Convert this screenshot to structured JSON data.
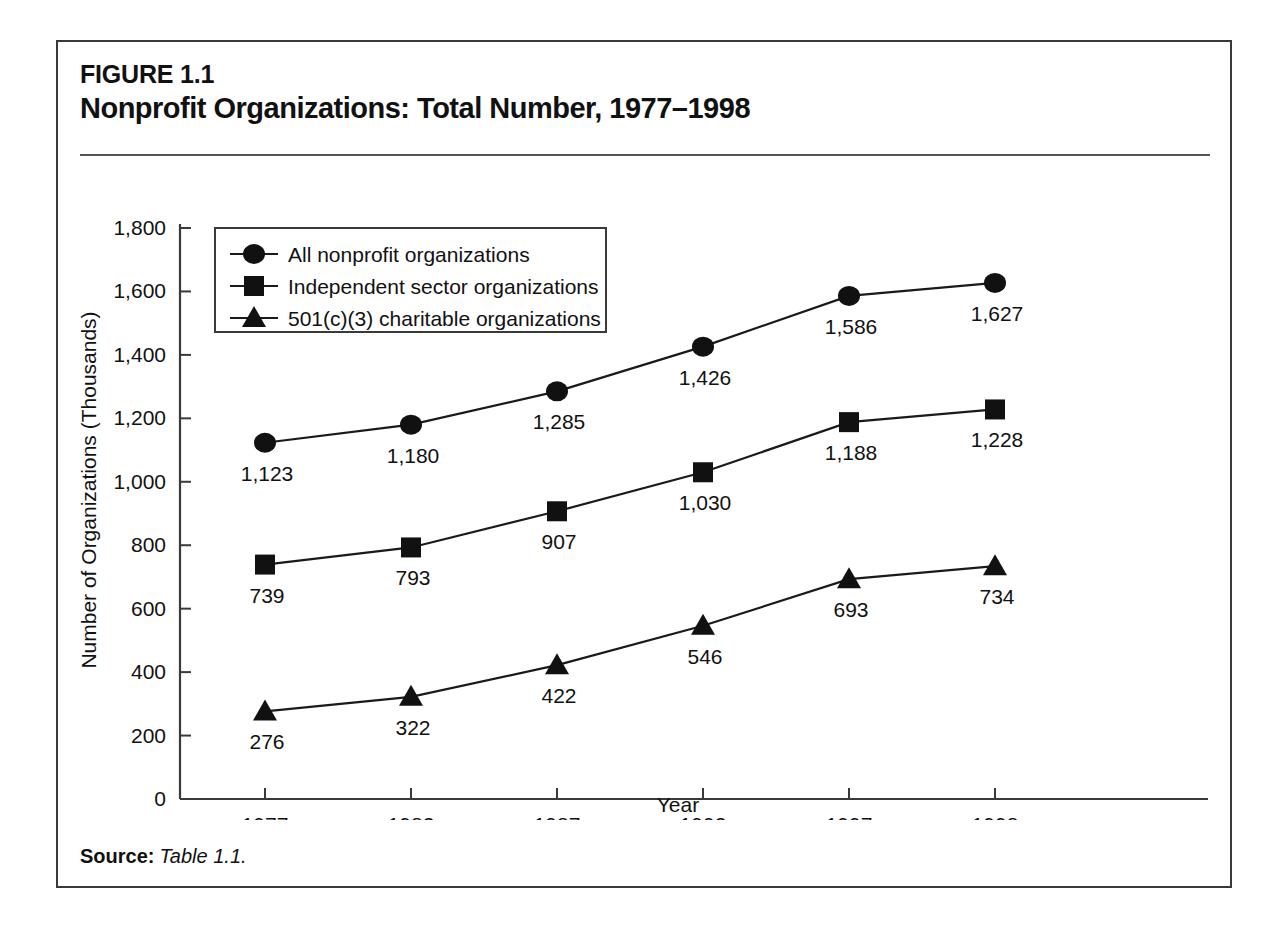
{
  "figure": {
    "number": "FIGURE 1.1",
    "title": "Nonprofit Organizations: Total Number, 1977–1998",
    "source_label": "Source:",
    "source_text": "Table 1.1."
  },
  "chart_data": {
    "type": "line",
    "title": "Nonprofit Organizations: Total Number, 1977–1998",
    "xlabel": "Year",
    "ylabel": "Number of Organizations (Thousands)",
    "categories": [
      "1977",
      "1982",
      "1987",
      "1992",
      "1997",
      "1998"
    ],
    "ylim": [
      0,
      1800
    ],
    "yticks": [
      0,
      200,
      400,
      600,
      800,
      1000,
      1200,
      1400,
      1600,
      1800
    ],
    "ytick_labels": [
      "0",
      "200",
      "400",
      "600",
      "800",
      "1,000",
      "1,200",
      "1,400",
      "1,600",
      "1,800"
    ],
    "grid": false,
    "legend_position": "upper-left",
    "series": [
      {
        "name": "All nonprofit organizations",
        "marker": "circle",
        "values": [
          1123,
          1180,
          1285,
          1426,
          1586,
          1627
        ],
        "labels": [
          "1,123",
          "1,180",
          "1,285",
          "1,426",
          "1,586",
          "1,627"
        ]
      },
      {
        "name": "Independent sector organizations",
        "marker": "square",
        "values": [
          739,
          793,
          907,
          1030,
          1188,
          1228
        ],
        "labels": [
          "739",
          "793",
          "907",
          "1,030",
          "1,188",
          "1,228"
        ]
      },
      {
        "name": "501(c)(3) charitable organizations",
        "marker": "triangle",
        "values": [
          276,
          322,
          422,
          546,
          693,
          734
        ],
        "labels": [
          "276",
          "322",
          "422",
          "546",
          "693",
          "734"
        ]
      }
    ],
    "colors": {
      "series": "#111111",
      "axis": "#3a3a3a",
      "background": "#ffffff"
    }
  }
}
